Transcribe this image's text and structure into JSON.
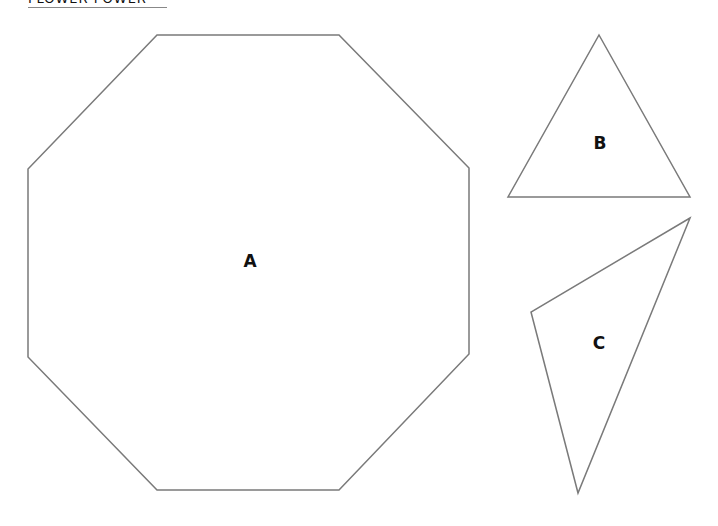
{
  "header": {
    "title": "FLOWER POWER"
  },
  "shapes": [
    {
      "id": "A",
      "label": "A",
      "type": "octagon"
    },
    {
      "id": "B",
      "label": "B",
      "type": "triangle"
    },
    {
      "id": "C",
      "label": "C",
      "type": "triangle"
    }
  ],
  "colors": {
    "stroke": "#7a7a7a",
    "fill": "#ffffff",
    "text": "#111111"
  }
}
